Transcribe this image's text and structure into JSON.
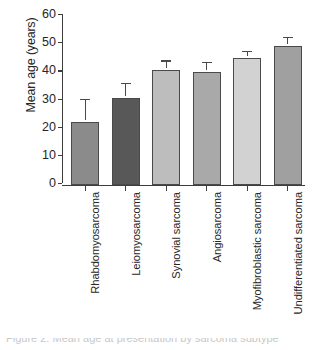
{
  "chart_data": {
    "type": "bar",
    "title": "",
    "xlabel": "",
    "ylabel": "Mean age (years)",
    "ylim": [
      0,
      60
    ],
    "yticks": [
      0,
      10,
      20,
      30,
      40,
      50,
      60
    ],
    "ytick_labels": [
      "0",
      "10",
      "20",
      "30",
      "40",
      "50",
      "60"
    ],
    "grid": false,
    "legend": "none",
    "error_bars": "upper only (SD)",
    "categories": [
      "Rhabdomyosarcoma",
      "Leiomyosarcoma",
      "Synovial sarcoma",
      "Angiosarcoma",
      "Myofibroblastic sarcoma",
      "Undifferentiated sarcoma"
    ],
    "values": [
      22.5,
      31,
      41,
      40,
      45,
      49.5
    ],
    "errors": [
      7.5,
      4.5,
      2.5,
      3,
      2,
      2.5
    ],
    "bar_colors": [
      "#8b8b8b",
      "#585858",
      "#bdbdbd",
      "#a9a9a9",
      "#d2d2d2",
      "#a0a0a0"
    ],
    "bar_edge_color": "#4a4a4a",
    "axis_color": "#3d3d3d",
    "background": "#ffffff"
  },
  "caption": {
    "text": "Figure 2. Mean age at presentation by sarcoma subtype"
  }
}
